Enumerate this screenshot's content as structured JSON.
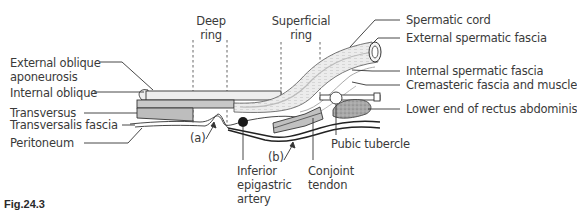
{
  "figure": {
    "caption": "Fig.24.3",
    "type": "anatomical cross-section diagram (inguinal canal)"
  },
  "labels": {
    "left": {
      "external_oblique": "External oblique",
      "aponeurosis": "aponeurosis",
      "internal_oblique": "Internal oblique",
      "transversus": "Transversus",
      "transversalis_fascia": "Transversalis fascia",
      "peritoneum": "Peritoneum"
    },
    "top": {
      "deep_ring_1": "Deep",
      "deep_ring_2": "ring",
      "superficial_ring_1": "Superficial",
      "superficial_ring_2": "ring"
    },
    "right": {
      "spermatic_cord": "Spermatic cord",
      "external_spermatic_fascia": "External spermatic fascia",
      "internal_spermatic_fascia": "Internal spermatic fascia",
      "cremasteric": "Cremasteric fascia and muscle",
      "rectus": "Lower end of rectus abdominis"
    },
    "bottom": {
      "marker_a": "(a)",
      "marker_b": "(b)",
      "inferior_1": "Inferior",
      "inferior_2": "epigastric",
      "inferior_3": "artery",
      "conjoint_1": "Conjoint",
      "conjoint_2": "tendon",
      "pubic_tubercle": "Pubic tubercle"
    }
  },
  "colors": {
    "line": "#333333",
    "aponeurosis_fill": "#eeeeee",
    "muscle_fill": "#bdbdbd",
    "cord_fill": "#e8e8e8",
    "rectus_fill": "#a8a8a8",
    "artery_fill": "#1a1a1a",
    "dashed": "#555555"
  }
}
